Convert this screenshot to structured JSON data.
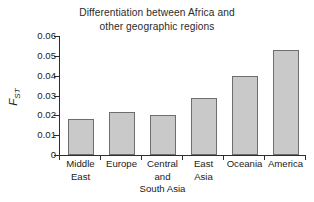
{
  "chart_data": {
    "type": "bar",
    "title": "Differentiation between Africa and other geographic regions",
    "title_lines": [
      "Differentiation between Africa and",
      "other geographic regions"
    ],
    "xlabel": "",
    "ylabel": "F",
    "ylabel_subscript": "ST",
    "categories": [
      "Middle East",
      "Europe",
      "Central and South Asia",
      "East Asia",
      "Oceania",
      "America"
    ],
    "category_lines": [
      [
        "Middle",
        "East"
      ],
      [
        "Europe"
      ],
      [
        "Central",
        "and",
        "South Asia"
      ],
      [
        "East",
        "Asia"
      ],
      [
        "Oceania"
      ],
      [
        "America"
      ]
    ],
    "values": [
      0.018,
      0.0217,
      0.02,
      0.0287,
      0.0398,
      0.0529
    ],
    "ylim": [
      0,
      0.06
    ],
    "yticks": [
      0,
      0.01,
      0.02,
      0.03,
      0.04,
      0.05,
      0.06
    ],
    "ytick_labels": [
      "0",
      "0.01",
      "0.02",
      "0.03",
      "0.04",
      "0.05",
      "0.06"
    ],
    "grid": false,
    "legend": null,
    "bar_fill_color": "#c9c9c9",
    "bar_edge_color": "#6e6e6e",
    "axis_color": "#2d2d2d",
    "background_color": "#ffffff"
  }
}
